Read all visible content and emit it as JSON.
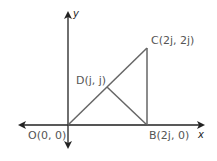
{
  "diagram": {
    "axes": {
      "x_label": "x",
      "y_label": "y",
      "axis_color": "#222222"
    },
    "shape_color": "#666666",
    "points": {
      "O": {
        "label": "O(0, 0)",
        "name": "O",
        "coords": "(0, 0)"
      },
      "B": {
        "label": "B(2j, 0)",
        "name": "B",
        "coords": "(2j, 0)"
      },
      "C": {
        "label": "C(2j, 2j)",
        "name": "C",
        "coords": "(2j, 2j)"
      },
      "D": {
        "label": "D(j, j)",
        "name": "D",
        "coords": "(j, j)"
      }
    },
    "segments": [
      "OC",
      "CB",
      "BD",
      "OB"
    ]
  }
}
